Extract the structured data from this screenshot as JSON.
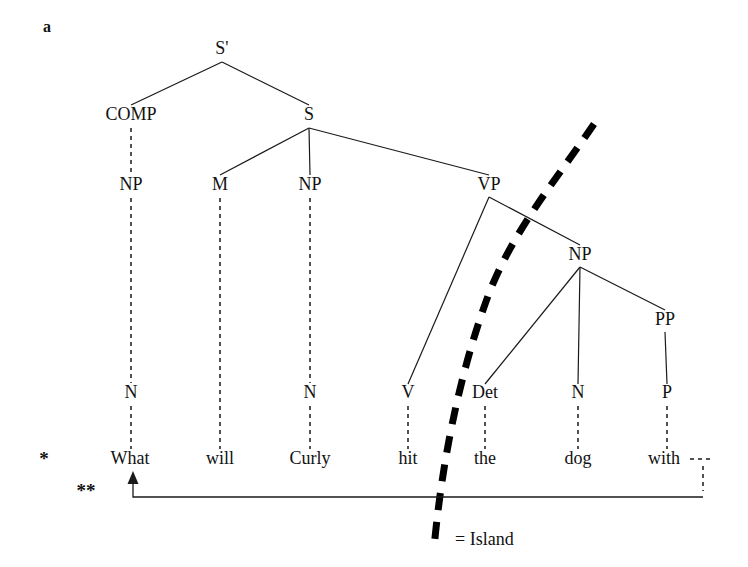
{
  "figure": {
    "panel_label": "a",
    "caption_legend": "= Island",
    "grammaticality_marks": {
      "single_star": "*",
      "double_star": "**"
    }
  },
  "tree": {
    "nodes": [
      {
        "id": "sbar",
        "label": "S'",
        "x": 222,
        "y": 54
      },
      {
        "id": "comp",
        "label": "COMP",
        "x": 131,
        "y": 120
      },
      {
        "id": "s",
        "label": "S",
        "x": 309,
        "y": 120
      },
      {
        "id": "np1",
        "label": "NP",
        "x": 131,
        "y": 190
      },
      {
        "id": "m",
        "label": "M",
        "x": 220,
        "y": 190
      },
      {
        "id": "np2",
        "label": "NP",
        "x": 310,
        "y": 190
      },
      {
        "id": "vp",
        "label": "VP",
        "x": 489,
        "y": 190
      },
      {
        "id": "np3",
        "label": "NP",
        "x": 580,
        "y": 260
      },
      {
        "id": "pp",
        "label": "PP",
        "x": 665,
        "y": 325
      },
      {
        "id": "n1",
        "label": "N",
        "x": 131,
        "y": 398
      },
      {
        "id": "n2",
        "label": "N",
        "x": 310,
        "y": 398
      },
      {
        "id": "v",
        "label": "V",
        "x": 408,
        "y": 398
      },
      {
        "id": "det",
        "label": "Det",
        "x": 485,
        "y": 398
      },
      {
        "id": "n3",
        "label": "N",
        "x": 578,
        "y": 398
      },
      {
        "id": "p",
        "label": "P",
        "x": 667,
        "y": 398
      }
    ],
    "terminals": [
      {
        "id": "t-what",
        "label": "What",
        "x": 130,
        "y": 464
      },
      {
        "id": "t-will",
        "label": "will",
        "x": 220,
        "y": 464
      },
      {
        "id": "t-curly",
        "label": "Curly",
        "x": 310,
        "y": 464
      },
      {
        "id": "t-hit",
        "label": "hit",
        "x": 408,
        "y": 464
      },
      {
        "id": "t-the",
        "label": "the",
        "x": 485,
        "y": 464
      },
      {
        "id": "t-dog",
        "label": "dog",
        "x": 578,
        "y": 464
      },
      {
        "id": "t-with",
        "label": "with",
        "x": 664,
        "y": 464
      }
    ],
    "sentence": "What will Curly hit the dog with",
    "solid_edges": [
      {
        "from": "sbar",
        "to": "comp",
        "d": "M 222 62 L 131 105"
      },
      {
        "from": "sbar",
        "to": "s",
        "d": "M 222 62 L 309 105"
      },
      {
        "from": "s",
        "to": "m",
        "d": "M 309 128 L 220 175"
      },
      {
        "from": "s",
        "to": "np2",
        "d": "M 309 128 L 310 175"
      },
      {
        "from": "s",
        "to": "vp",
        "d": "M 309 128 L 489 175"
      },
      {
        "from": "vp",
        "to": "v",
        "d": "M 489 197 L 408 384"
      },
      {
        "from": "vp",
        "to": "np3",
        "d": "M 489 197 L 580 245"
      },
      {
        "from": "np3",
        "to": "det",
        "d": "M 580 267 L 485 384"
      },
      {
        "from": "np3",
        "to": "n3",
        "d": "M 580 267 L 578 384"
      },
      {
        "from": "np3",
        "to": "pp",
        "d": "M 580 267 L 665 310"
      },
      {
        "from": "pp",
        "to": "p",
        "d": "M 665 332 L 667 384"
      }
    ],
    "dashed_edges": [
      {
        "from": "comp",
        "to": "np1",
        "d": "M 131 128 L 131 175"
      },
      {
        "from": "np1",
        "to": "n1",
        "d": "M 131 198 L 131 383"
      },
      {
        "from": "np2",
        "to": "n2",
        "d": "M 310 198 L 310 383"
      },
      {
        "from": "m",
        "to": "t-will",
        "d": "M 220 198 L 220 449"
      },
      {
        "from": "n1",
        "to": "t-what",
        "d": "M 131 406 L 131 449"
      },
      {
        "from": "n2",
        "to": "t-curly",
        "d": "M 310 406 L 310 449"
      },
      {
        "from": "v",
        "to": "t-hit",
        "d": "M 408 406 L 408 449"
      },
      {
        "from": "det",
        "to": "t-the",
        "d": "M 485 406 L 485 449"
      },
      {
        "from": "n3",
        "to": "t-dog",
        "d": "M 578 406 L 578 449"
      },
      {
        "from": "p",
        "to": "t-with",
        "d": "M 667 406 L 667 449"
      }
    ]
  },
  "island_boundary": {
    "name": "island-curve",
    "path": "M 594 124 C 556 180, 512 232, 488 296 C 466 356, 444 440, 434 548",
    "color": "#000000",
    "style": "thick-dashed"
  },
  "movement": {
    "name": "wh-movement-arc",
    "description": "arrow from trace position after 'with' back to 'What'",
    "path": "M 703 497 L 133 497 L 133 477",
    "arrowhead_at": {
      "x": 133,
      "y": 471
    },
    "trace_dashes": [
      {
        "d": "M 690 459 L 712 459"
      },
      {
        "d": "M 703 466 L 703 491"
      }
    ]
  },
  "marks": {
    "single_star": {
      "text": "*",
      "x": 44,
      "y": 465
    },
    "double_star": {
      "text": "**",
      "x": 86,
      "y": 497
    }
  },
  "legend": {
    "text": "= Island",
    "x": 455,
    "y": 545
  },
  "panel": {
    "text": "a",
    "x": 47,
    "y": 32
  }
}
